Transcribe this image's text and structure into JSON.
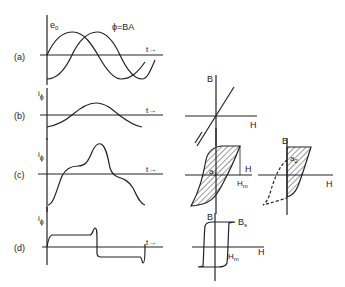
{
  "panels": {
    "a": {
      "label": "(a)",
      "curve1_label": "e",
      "curve1_sub": "0",
      "curve2_label": "ϕ=BA",
      "time_label": "t→"
    },
    "b": {
      "label": "(b)",
      "y_label": "i",
      "y_sub": "ϕ",
      "time_label": "t→",
      "bh_B": "B",
      "bh_H": "H"
    },
    "c": {
      "label": "(c)",
      "y_label": "i",
      "y_sub": "ϕ",
      "time_label": "t→",
      "loop1_area": "a",
      "loop1_area_sub": "1",
      "loop1_H": "H",
      "loop1_Hm": "H",
      "loop1_Hm_sub": "m",
      "loop2_B": "B",
      "loop2_area": "a",
      "loop2_area_sub": "2",
      "loop2_H": "H"
    },
    "d": {
      "label": "(d)",
      "y_label": "i",
      "y_sub": "ϕ",
      "time_label": "t→",
      "bh_B": "B",
      "bh_Bs": "B",
      "bh_Bs_sub": "s",
      "bh_Hm": "H",
      "bh_Hm_sub": "m",
      "bh_H": "H"
    }
  },
  "colors": {
    "ink": "#222222",
    "background": "#ffffff"
  }
}
